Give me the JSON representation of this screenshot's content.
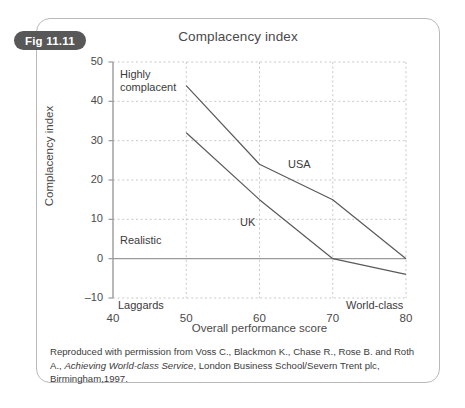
{
  "figure": {
    "badge": "Fig 11.11",
    "title": "Complacency index",
    "caption_line1": "Reproduced with permission from Voss C., Blackmon K., Chase R., Rose B. and Roth A.,",
    "caption_italic": "Achieving World-class Service",
    "caption_line2_rest": ", London Business School/Severn Trent plc, Birmingham,1997.",
    "border_color": "#b9b9b9",
    "badge_bg": "#585858",
    "badge_fg": "#ffffff"
  },
  "chart_data": {
    "type": "line",
    "title": "Complacency index",
    "xlabel": "Overall performance score",
    "ylabel": "Complacency index",
    "xlim": [
      40,
      80
    ],
    "ylim": [
      -10,
      50
    ],
    "xticks": [
      40,
      50,
      60,
      70,
      80
    ],
    "yticks": [
      50,
      40,
      30,
      20,
      10,
      0,
      -10
    ],
    "xtick_labels": [
      "40",
      "50",
      "60",
      "70",
      "80"
    ],
    "ytick_labels": [
      "50",
      "40",
      "30",
      "20",
      "10",
      "0",
      "–10"
    ],
    "grid": "dashed vertical at 50,60,70,80; dashed horizontal at 40,30,20,10,-10; solid zero line at 0",
    "legend": "inline labels on lines",
    "line_color": "#5a5a5a",
    "grid_color": "#c8c8c8",
    "axis_color": "#8f8f8f",
    "annotations": [
      {
        "name": "highly-complacent",
        "text": "Highly\ncomplacent",
        "x": 42.5,
        "y": 47
      },
      {
        "name": "realistic",
        "text": "Realistic",
        "x": 42.5,
        "y": 4.5
      },
      {
        "name": "laggards",
        "text": "Laggards",
        "x": 41.5,
        "y": -11.5
      },
      {
        "name": "world-class",
        "text": "World-class",
        "x": 73.5,
        "y": -11.5
      }
    ],
    "series": [
      {
        "name": "USA",
        "label": "USA",
        "x": [
          50,
          60,
          70,
          80
        ],
        "values": [
          44,
          24,
          15,
          0
        ],
        "label_x": 64,
        "label_y": 22
      },
      {
        "name": "UK",
        "label": "UK",
        "x": [
          50,
          60,
          70,
          80
        ],
        "values": [
          32,
          15,
          0,
          -4
        ],
        "label_x": 57.5,
        "label_y": 7
      }
    ]
  }
}
